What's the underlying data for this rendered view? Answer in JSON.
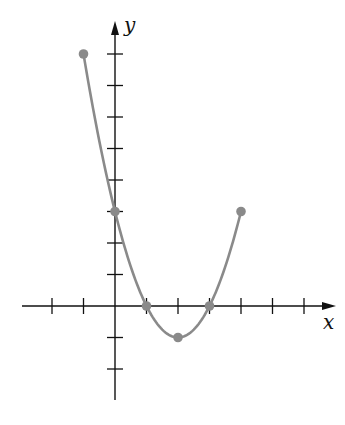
{
  "chart_data": {
    "type": "line",
    "title": "",
    "xlabel": "x",
    "ylabel": "y",
    "xlim": [
      -3,
      7
    ],
    "ylim": [
      -3,
      9
    ],
    "grid": false,
    "x_ticks": [
      -2,
      -1,
      1,
      2,
      3,
      4,
      5,
      6
    ],
    "y_ticks": [
      -2,
      -1,
      1,
      2,
      3,
      4,
      5,
      6,
      7,
      8
    ],
    "tick_labels_shown": false,
    "series": [
      {
        "name": "parabola",
        "function": "y = x^2 - 4x + 3",
        "domain": [
          -1,
          4
        ],
        "x": [
          -1,
          0,
          1,
          2,
          3,
          4
        ],
        "y": [
          8,
          3,
          0,
          -1,
          0,
          3
        ],
        "color": "#8a8a8a"
      }
    ],
    "marked_points": [
      {
        "x": -1,
        "y": 8,
        "label": "endpoint"
      },
      {
        "x": 0,
        "y": 3,
        "label": "y-intercept"
      },
      {
        "x": 1,
        "y": 0,
        "label": "x-intercept"
      },
      {
        "x": 2,
        "y": -1,
        "label": "vertex"
      },
      {
        "x": 3,
        "y": 0,
        "label": "x-intercept"
      },
      {
        "x": 4,
        "y": 3,
        "label": "endpoint"
      }
    ]
  },
  "colors": {
    "axis": "#111111",
    "curve": "#8a8a8a",
    "point": "#8a8a8a"
  }
}
